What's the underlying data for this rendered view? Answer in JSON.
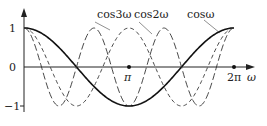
{
  "chart_data": {
    "type": "line",
    "title": "",
    "xlabel": "ω",
    "ylabel": "",
    "xlim": [
      0,
      6.2832
    ],
    "ylim": [
      -1,
      1
    ],
    "x_ticks": [
      {
        "value": 3.1416,
        "label": "π"
      },
      {
        "value": 6.2832,
        "label": "2π"
      }
    ],
    "y_ticks": [
      {
        "value": 1,
        "label": "1"
      },
      {
        "value": 0,
        "label": "0"
      },
      {
        "value": -1,
        "label": "−1"
      }
    ],
    "grid": false,
    "series": [
      {
        "name": "cosω",
        "function": "cos(ω)",
        "style": "solid-thick",
        "color": "#111111"
      },
      {
        "name": "cos2ω",
        "function": "cos(2ω)",
        "style": "dashed",
        "color": "#333333"
      },
      {
        "name": "cos3ω",
        "function": "cos(3ω)",
        "style": "long-dashed",
        "color": "#333333"
      }
    ],
    "annotations": [
      "cos3ω",
      "cos2ω",
      "cosω"
    ]
  },
  "labels": {
    "y1": "1",
    "y0": "0",
    "yneg1": "−1",
    "pi": "π",
    "twopi": "2π",
    "omega": "ω",
    "cos3": "cos3ω",
    "cos2": "cos2ω",
    "cos1": "cosω"
  }
}
